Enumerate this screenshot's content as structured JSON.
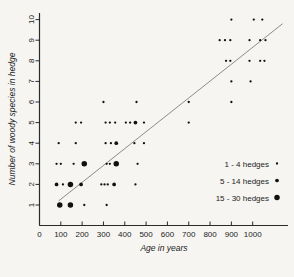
{
  "figure": {
    "background": "#f6f5f2",
    "axis_color": "#2b2b2b",
    "text_color": "#1c1c1c"
  },
  "chart_data": {
    "type": "scatter",
    "title": "",
    "xlabel": "Age in years",
    "ylabel": "Number of woody species in hedge",
    "xlim": [
      0,
      1170
    ],
    "ylim": [
      0.5,
      10.6
    ],
    "xticks": [
      0,
      100,
      200,
      300,
      400,
      500,
      600,
      700,
      800,
      900,
      1000
    ],
    "yticks": [
      1,
      2,
      3,
      4,
      5,
      6,
      7,
      8,
      9,
      10
    ],
    "grid": false,
    "point_color": "#111111",
    "trend_line": {
      "x1": 90,
      "y1": 1.2,
      "x2": 1140,
      "y2": 9.8,
      "color": "#8c8c8c"
    },
    "size_classes": {
      "small": {
        "label": "1 - 4 hedges",
        "radius": 1.15
      },
      "medium": {
        "label": "5 - 14 hedges",
        "radius": 1.85
      },
      "large": {
        "label": "15 - 30 hedges",
        "radius": 2.75
      }
    },
    "legend": {
      "position": "right-middle",
      "order": [
        "small",
        "medium",
        "large"
      ]
    },
    "points": [
      [
        95,
        1,
        "large"
      ],
      [
        145,
        1,
        "large"
      ],
      [
        210,
        1,
        "small"
      ],
      [
        315,
        1,
        "small"
      ],
      [
        80,
        2,
        "medium"
      ],
      [
        110,
        2,
        "small"
      ],
      [
        145,
        2,
        "large"
      ],
      [
        195,
        2,
        "medium"
      ],
      [
        290,
        2,
        "small"
      ],
      [
        305,
        2,
        "small"
      ],
      [
        320,
        2,
        "small"
      ],
      [
        350,
        2,
        "medium"
      ],
      [
        450,
        2,
        "small"
      ],
      [
        80,
        3,
        "small"
      ],
      [
        100,
        3,
        "small"
      ],
      [
        160,
        3,
        "small"
      ],
      [
        210,
        3,
        "large"
      ],
      [
        315,
        3,
        "small"
      ],
      [
        330,
        3,
        "small"
      ],
      [
        360,
        3,
        "large"
      ],
      [
        460,
        3,
        "small"
      ],
      [
        90,
        4,
        "small"
      ],
      [
        170,
        4,
        "small"
      ],
      [
        310,
        4,
        "small"
      ],
      [
        335,
        4,
        "small"
      ],
      [
        360,
        4,
        "medium"
      ],
      [
        445,
        4,
        "small"
      ],
      [
        490,
        4,
        "small"
      ],
      [
        170,
        5,
        "small"
      ],
      [
        195,
        5,
        "small"
      ],
      [
        310,
        5,
        "small"
      ],
      [
        330,
        5,
        "small"
      ],
      [
        355,
        5,
        "small"
      ],
      [
        405,
        5,
        "small"
      ],
      [
        425,
        5,
        "small"
      ],
      [
        450,
        5,
        "medium"
      ],
      [
        490,
        5,
        "small"
      ],
      [
        700,
        5,
        "small"
      ],
      [
        300,
        6,
        "small"
      ],
      [
        455,
        6,
        "small"
      ],
      [
        700,
        6,
        "small"
      ],
      [
        900,
        6,
        "small"
      ],
      [
        900,
        7,
        "small"
      ],
      [
        990,
        7,
        "small"
      ],
      [
        875,
        8,
        "small"
      ],
      [
        895,
        8,
        "small"
      ],
      [
        985,
        8,
        "small"
      ],
      [
        1035,
        8,
        "small"
      ],
      [
        1055,
        8,
        "small"
      ],
      [
        845,
        9,
        "small"
      ],
      [
        870,
        9,
        "small"
      ],
      [
        895,
        9,
        "small"
      ],
      [
        985,
        9,
        "small"
      ],
      [
        1035,
        9,
        "small"
      ],
      [
        1060,
        9,
        "small"
      ],
      [
        900,
        10,
        "small"
      ],
      [
        1005,
        10,
        "small"
      ],
      [
        1045,
        10,
        "small"
      ]
    ]
  }
}
